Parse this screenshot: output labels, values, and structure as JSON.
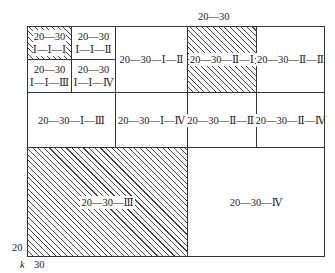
{
  "top_label": "20—30",
  "corner": {
    "y_label": "20",
    "k_label": "k",
    "x_label": "30"
  },
  "cells": {
    "c111": {
      "line1": "20—30",
      "line2": "Ⅰ—Ⅰ—Ⅰ",
      "hatched": true
    },
    "c112": {
      "line1": "20—30",
      "line2": "Ⅰ—Ⅰ—Ⅱ",
      "hatched": false
    },
    "c113": {
      "line1": "20—30",
      "line2": "Ⅰ—Ⅰ—Ⅲ",
      "hatched": false
    },
    "c114": {
      "line1": "20—30",
      "line2": "Ⅰ—Ⅰ—Ⅳ",
      "hatched": false
    },
    "c12": {
      "label": "20—30—Ⅰ—Ⅱ",
      "hatched": false
    },
    "c21": {
      "label": "20—30—Ⅱ—Ⅰ",
      "hatched": true
    },
    "c22": {
      "label": "20—30—Ⅱ—Ⅱ",
      "hatched": false
    },
    "c13": {
      "label": "20—30—Ⅰ—Ⅲ",
      "hatched": false
    },
    "c14": {
      "label": "20—30—Ⅰ—Ⅳ",
      "hatched": false
    },
    "c23": {
      "label": "20—30—Ⅱ—Ⅲ",
      "hatched": false
    },
    "c24": {
      "label": "20—30—Ⅱ—Ⅳ",
      "hatched": false
    },
    "c3": {
      "label": "20—30—Ⅲ",
      "hatched": true
    },
    "c4": {
      "label": "20—30—Ⅳ",
      "hatched": false
    }
  }
}
